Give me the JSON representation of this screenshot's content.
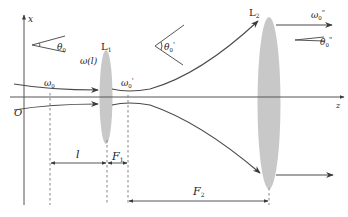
{
  "diagram": {
    "type": "gaussian-beam-two-lens-expander",
    "axes": {
      "x_label": "x",
      "z_label": "z",
      "origin_label": "O"
    },
    "lenses": [
      {
        "id": "L1",
        "label": "L",
        "sub": "1"
      },
      {
        "id": "L2",
        "label": "L",
        "sub": "2"
      }
    ],
    "beam_labels": {
      "waist_in": {
        "main": "ω",
        "sub": "0",
        "prime": ""
      },
      "spot_at_l1": "ω(l)",
      "waist_mid": {
        "main": "ω",
        "sub": "0",
        "prime": "'"
      },
      "waist_out": {
        "main": "ω",
        "sub": "0",
        "prime": "\""
      }
    },
    "angles": [
      {
        "id": "theta0",
        "main": "θ",
        "sub": "0",
        "prime": ""
      },
      {
        "id": "theta0p",
        "main": "θ",
        "sub": "0",
        "prime": "'"
      },
      {
        "id": "theta0pp",
        "main": "θ",
        "sub": "0",
        "prime": "\""
      }
    ],
    "dimensions": [
      {
        "id": "l",
        "label": "l"
      },
      {
        "id": "F1",
        "main": "F",
        "sub": "1"
      },
      {
        "id": "F2",
        "main": "F",
        "sub": "2"
      }
    ],
    "colors": {
      "lens_fill": "#c8c8c8",
      "line": "#4a4a4a",
      "background": "#ffffff"
    }
  }
}
